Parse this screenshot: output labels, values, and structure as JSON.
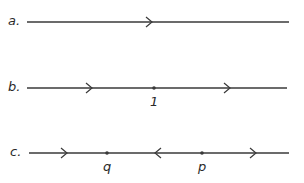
{
  "diagrams": [
    {
      "id": "a",
      "label": "a.",
      "y": 22,
      "x_start": 27,
      "x_end": 289,
      "arrows": [
        {
          "x": 150,
          "direction": "right"
        }
      ],
      "points": []
    },
    {
      "id": "b",
      "label": "b.",
      "y": 88,
      "x_start": 27,
      "x_end": 287,
      "arrows": [
        {
          "x": 90,
          "direction": "right"
        },
        {
          "x": 228,
          "direction": "right"
        }
      ],
      "points": [
        {
          "x": 154,
          "label": "1"
        }
      ]
    },
    {
      "id": "c",
      "label": "c.",
      "y": 153,
      "x_start": 29,
      "x_end": 289,
      "arrows": [
        {
          "x": 65,
          "direction": "right"
        },
        {
          "x": 157,
          "direction": "left"
        },
        {
          "x": 254,
          "direction": "right"
        }
      ],
      "points": [
        {
          "x": 107,
          "label": "q"
        },
        {
          "x": 202,
          "label": "p"
        }
      ]
    }
  ],
  "colors": {
    "stroke": "#3a3a3a",
    "text": "#2a2a2a"
  }
}
